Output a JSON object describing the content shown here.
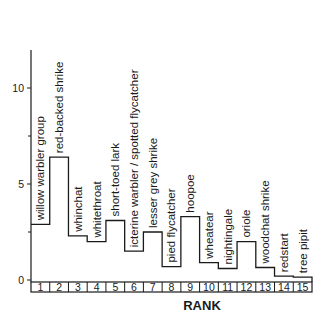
{
  "chart_data": {
    "type": "bar",
    "style": "step",
    "title": "",
    "xlabel": "RANK",
    "ylabel": "",
    "ylim": [
      0,
      12
    ],
    "yticks": [
      0,
      5,
      10
    ],
    "yminor_ticks": [
      2.5,
      7.5
    ],
    "grid": false,
    "legend": null,
    "categories": [
      "1",
      "2",
      "3",
      "4",
      "5",
      "6",
      "7",
      "8",
      "9",
      "10",
      "11",
      "12",
      "13",
      "14",
      "15"
    ],
    "labels": [
      "willow warbler group",
      "red-backed shrike",
      "whinchat",
      "whitethroat",
      "short-toed lark",
      "icterine warbler / spotted flycatcher",
      "lesser grey shrike",
      "pied flycatcher",
      "hoopoe",
      "wheatear",
      "nightingale",
      "oriole",
      "woodchat shrike",
      "redstart",
      "tree pipit"
    ],
    "values": [
      2.9,
      6.4,
      2.3,
      2.0,
      3.1,
      1.5,
      2.5,
      0.7,
      3.3,
      0.9,
      0.6,
      2.0,
      0.65,
      0.2,
      0.15
    ]
  },
  "colors": {
    "ink": "#1a1a1a",
    "background": "#ffffff"
  }
}
